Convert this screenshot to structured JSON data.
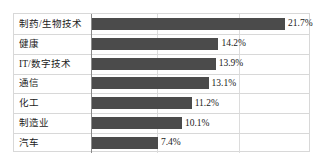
{
  "chart_data": {
    "type": "bar",
    "orientation": "horizontal",
    "title": "",
    "subtitle": "",
    "xlabel": "",
    "ylabel": "",
    "categories": [
      "制药/生物技术",
      "健康",
      "IT/数字技术",
      "通信",
      "化工",
      "制造业",
      "汽车"
    ],
    "values": [
      21.7,
      14.2,
      13.9,
      13.1,
      11.2,
      10.1,
      7.4
    ],
    "value_labels": [
      "21.7%",
      "14.2%",
      "13.9%",
      "13.1%",
      "11.2%",
      "10.1%",
      "7.4%"
    ],
    "unit": "%",
    "xlim": [
      0,
      24.5
    ],
    "grid": {
      "vertical": true,
      "horizontal": true,
      "vertical_positions": [
        9.2,
        18.4
      ]
    },
    "legend": {
      "visible": false,
      "position": "none"
    },
    "tick_labels": [],
    "colors": {
      "bar": "#4b4b4b",
      "grid": "#dcdcdc",
      "frame": "#d8d8d8",
      "axis": "#8a8a8a",
      "text": "#1b1b1b",
      "background": "#ffffff"
    }
  }
}
